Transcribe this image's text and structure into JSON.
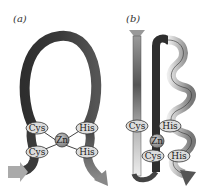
{
  "figure": {
    "panel_a": {
      "label": "(a)",
      "residues": {
        "cys_top": "Cys",
        "cys_bottom": "Cys",
        "his_top": "His",
        "his_bottom": "His"
      },
      "metal": "Zn"
    },
    "panel_b": {
      "label": "(b)",
      "residues": {
        "cys_top": "Cys",
        "cys_bottom": "Cys",
        "his_top": "His",
        "his_bottom": "His"
      },
      "metal": "Zn"
    },
    "colors": {
      "ribbon_dark": "#3a3a3a",
      "ribbon_mid": "#7a7a7a",
      "ribbon_light": "#d8d8d8",
      "residue_fill": "#dcdcdc",
      "zn_fill": "#9a9a9a",
      "bond": "#444444"
    }
  }
}
